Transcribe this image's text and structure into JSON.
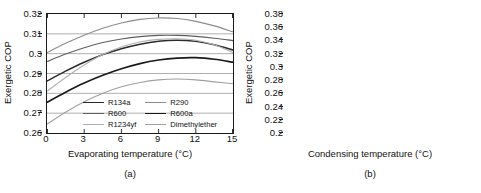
{
  "figure": {
    "panels": [
      {
        "id": "a",
        "caption": "(a)",
        "ylabel": "Exergetic COP",
        "xlabel": "Evaporating temperature (°C)"
      },
      {
        "id": "b",
        "caption": "(b)",
        "ylabel": "Exergetic COP",
        "xlabel": "Condensing temperature (°C)"
      }
    ]
  },
  "series_style": [
    {
      "name": "R134a",
      "color": "#2b2b2b",
      "width": 1.5
    },
    {
      "name": "R290",
      "color": "#8c8c8c",
      "width": 1.1
    },
    {
      "name": "R600",
      "color": "#5e5e5e",
      "width": 1.1
    },
    {
      "name": "R600a",
      "color": "#1a1a1a",
      "width": 1.7
    },
    {
      "name": "R1234yf",
      "color": "#b0b0b0",
      "width": 1.1
    },
    {
      "name": "Dimethylether",
      "color": "#a0a0a0",
      "width": 1.1
    }
  ],
  "chart_data": [
    {
      "type": "line",
      "panel": "a",
      "title": "",
      "xlabel": "Evaporating temperature (°C)",
      "ylabel": "Exergetic COP",
      "xlim": [
        0,
        15
      ],
      "ylim": [
        0.26,
        0.32
      ],
      "xticks": [
        0,
        3,
        6,
        9,
        12,
        15
      ],
      "yticks": [
        0.26,
        0.27,
        0.28,
        0.29,
        0.3,
        0.31,
        0.32
      ],
      "xticklabels": [
        "0",
        "3",
        "6",
        "9",
        "12",
        "15"
      ],
      "yticklabels": [
        "0.26",
        "0.27",
        "0.28",
        "0.29",
        "0.3",
        "0.31",
        "0.32"
      ],
      "grid": "horizontal",
      "legend_position": "lower-center",
      "legend": [
        "R134a",
        "R290",
        "R600",
        "R600a",
        "R1234yf",
        "Dimethylether"
      ],
      "x": [
        0,
        1.5,
        3,
        4.5,
        6,
        7.5,
        9,
        10.5,
        12,
        13.5,
        15
      ],
      "series": [
        {
          "name": "R134a",
          "values": [
            0.2862,
            0.2912,
            0.2957,
            0.2995,
            0.3025,
            0.3048,
            0.3063,
            0.3068,
            0.3062,
            0.3045,
            0.3018
          ]
        },
        {
          "name": "R290",
          "values": [
            0.3005,
            0.3052,
            0.3093,
            0.3128,
            0.3155,
            0.3173,
            0.318,
            0.3177,
            0.3163,
            0.314,
            0.311
          ]
        },
        {
          "name": "R600",
          "values": [
            0.296,
            0.2998,
            0.303,
            0.3056,
            0.3074,
            0.3086,
            0.3092,
            0.3092,
            0.3087,
            0.3078,
            0.3066
          ]
        },
        {
          "name": "R600a",
          "values": [
            0.2755,
            0.2806,
            0.2852,
            0.2891,
            0.2924,
            0.295,
            0.2968,
            0.2978,
            0.298,
            0.2972,
            0.2957
          ]
        },
        {
          "name": "R1234yf",
          "values": [
            0.281,
            0.288,
            0.2943,
            0.2996,
            0.3034,
            0.3059,
            0.3072,
            0.3075,
            0.3068,
            0.3045,
            0.3005
          ]
        },
        {
          "name": "Dimethylether",
          "values": [
            0.2645,
            0.2705,
            0.2757,
            0.28,
            0.2833,
            0.2855,
            0.2868,
            0.2872,
            0.2868,
            0.2858,
            0.2848
          ]
        }
      ]
    },
    {
      "type": "line",
      "panel": "b",
      "title": "",
      "xlabel": "Condensing temperature (°C)",
      "ylabel": "Exergetic COP",
      "xlim": [
        50,
        65
      ],
      "ylim": [
        0.2,
        0.38
      ],
      "xticks": [
        50,
        53,
        56,
        59,
        62,
        65
      ],
      "yticks": [
        0.2,
        0.22,
        0.24,
        0.26,
        0.28,
        0.3,
        0.32,
        0.34,
        0.36,
        0.38
      ],
      "xticklabels": [
        "50",
        "53",
        "56",
        "59",
        "62",
        "65"
      ],
      "yticklabels": [
        "0.2",
        "0.22",
        "0.24",
        "0.26",
        "0.28",
        "0.3",
        "0.32",
        "0.34",
        "0.36",
        "0.38"
      ],
      "grid": "horizontal",
      "legend_position": "upper-center",
      "legend": [
        "R134a",
        "R290",
        "R600",
        "R600a",
        "R1234yf",
        "Dimethylether"
      ],
      "x": [
        50,
        51.5,
        53,
        54.5,
        56,
        57.5,
        59,
        60.5,
        62,
        63.5,
        65
      ],
      "series": [
        {
          "name": "R134a",
          "values": [
            0.357,
            0.3415,
            0.3258,
            0.3098,
            0.2938,
            0.2778,
            0.262,
            0.2466,
            0.2318,
            0.2176,
            0.2045
          ]
        },
        {
          "name": "R290",
          "values": [
            0.346,
            0.331,
            0.3158,
            0.3004,
            0.285,
            0.2696,
            0.2545,
            0.2398,
            0.2258,
            0.2125,
            0.2005
          ]
        },
        {
          "name": "R600",
          "values": [
            0.3615,
            0.3468,
            0.3318,
            0.3165,
            0.301,
            0.2856,
            0.2704,
            0.2556,
            0.2414,
            0.2282,
            0.216
          ]
        },
        {
          "name": "R600a",
          "values": [
            0.3545,
            0.3392,
            0.3236,
            0.3078,
            0.2918,
            0.276,
            0.2604,
            0.2452,
            0.2308,
            0.2172,
            0.2048
          ]
        },
        {
          "name": "R1234yf",
          "values": [
            0.3345,
            0.3195,
            0.3042,
            0.2886,
            0.273,
            0.2574,
            0.242,
            0.227,
            0.2128,
            0.1996,
            0.1878
          ]
        },
        {
          "name": "Dimethylether",
          "values": [
            0.368,
            0.354,
            0.3398,
            0.3252,
            0.3104,
            0.2956,
            0.2808,
            0.2662,
            0.252,
            0.2386,
            0.2262
          ]
        }
      ]
    }
  ]
}
